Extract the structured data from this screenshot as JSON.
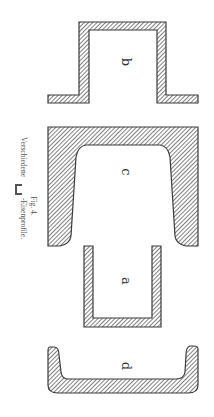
{
  "figure": {
    "number": "Fig. 4.",
    "caption_prefix": "Verschiedene",
    "caption_symbol": "⊏",
    "caption_suffix": "-Eisenprofile.",
    "orientation": "rotated 90° clockwise"
  },
  "profiles": [
    {
      "id": "b",
      "label": "b",
      "shape": "hat-section (top-hat channel with outward flanges)"
    },
    {
      "id": "c",
      "label": "c",
      "shape": "heavy channel with tapered flanges"
    },
    {
      "id": "a",
      "label": "a",
      "shape": "thin plate channel"
    },
    {
      "id": "d",
      "label": "d",
      "shape": "shallow rolled channel with rounded flanges"
    }
  ],
  "colors": {
    "hatch": "#3a3a3a",
    "background": "#ffffff",
    "text": "#333333"
  }
}
